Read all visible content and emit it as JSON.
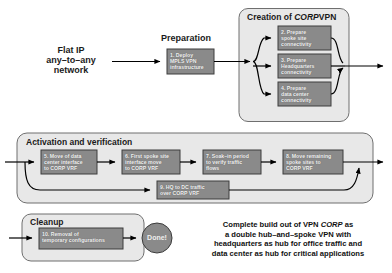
{
  "diagram": {
    "title_source": "Flat IP\nany-to-any\nnetwork",
    "source_node": {
      "line1": "Flat IP",
      "line2": "any–to–any",
      "line3": "network"
    },
    "phases": [
      {
        "id": "preparation",
        "label": "Preparation"
      },
      {
        "id": "creation",
        "label_prefix": "Creation of ",
        "label_italic": "CORP",
        "label_suffix": "VPN"
      },
      {
        "id": "activation",
        "label": "Activation and verification"
      },
      {
        "id": "cleanup",
        "label": "Cleanup"
      }
    ],
    "steps": [
      {
        "num": "1.",
        "lines": [
          "1. Deploy",
          "MPLS VPN",
          "infrastructure"
        ],
        "phase": "preparation"
      },
      {
        "num": "2.",
        "lines": [
          "2. Prepare",
          "spoke site",
          "connectivity"
        ],
        "phase": "creation"
      },
      {
        "num": "3.",
        "lines": [
          "3. Prepare",
          "Headquarters",
          "connectivity"
        ],
        "phase": "creation"
      },
      {
        "num": "4.",
        "lines": [
          "4. Prepare",
          "data center",
          "connectivity"
        ],
        "phase": "creation"
      },
      {
        "num": "5.",
        "lines": [
          "5. Move of data",
          "center interface",
          "to CORP VRF"
        ],
        "italic_on": [
          "CORP"
        ],
        "phase": "activation"
      },
      {
        "num": "6.",
        "lines": [
          "6. First spoke site",
          "interface move",
          "to CORP VRF"
        ],
        "italic_on": [
          "CORP"
        ],
        "phase": "activation"
      },
      {
        "num": "7.",
        "lines": [
          "7. Soak–in period",
          "to verify traffic",
          "flows"
        ],
        "phase": "activation"
      },
      {
        "num": "8.",
        "lines": [
          "8. Move remaining",
          "spoke sites to",
          "CORP VRF"
        ],
        "italic_on": [
          "CORP"
        ],
        "phase": "activation"
      },
      {
        "num": "9.",
        "lines": [
          "9. HQ to DC traffic",
          "over CORP VRF"
        ],
        "italic_on": [
          "CORP"
        ],
        "phase": "activation"
      },
      {
        "num": "10.",
        "lines": [
          "10. Removal of",
          "temporary configurations"
        ],
        "phase": "cleanup"
      }
    ],
    "terminal_node": {
      "label": "Done!"
    },
    "summary": {
      "line1_a": "Complete build out of VPN ",
      "line1_it": "CORP",
      "line1_b": " as",
      "line2": "a double hub–and–spoke VPN with",
      "line3": "headquarters as hub for office traffic and",
      "line4": "data center as hub for critical applications"
    },
    "colors": {
      "step_box_fill": "#8a8a8a",
      "step_box_stroke": "#3c3c3c",
      "group_fill": "#e8e8e8",
      "group_stroke": "#6f6f6f",
      "done_fill": "#8a8a8a",
      "arrow": "#000000",
      "page_background": "#ffffff",
      "text_on_box": "#f2f2f2"
    }
  }
}
